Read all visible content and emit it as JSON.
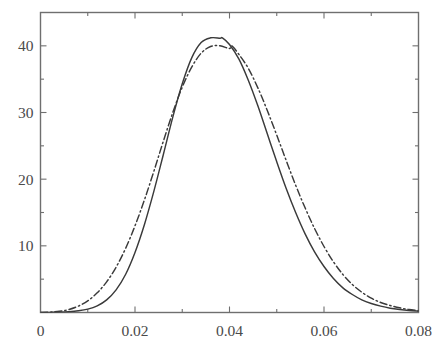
{
  "chart_data": {
    "type": "line",
    "title": "",
    "xlabel": "",
    "ylabel": "",
    "xlim": [
      0,
      0.08
    ],
    "ylim": [
      0,
      45
    ],
    "grid": false,
    "legend_position": "none",
    "x_ticks": [
      0,
      0.02,
      0.04,
      0.06,
      0.08
    ],
    "x_tick_labels": [
      "0",
      "0.02",
      "0.04",
      "0.06",
      "0.08"
    ],
    "x_minor_ticks": [
      0.01,
      0.03,
      0.05,
      0.07
    ],
    "y_ticks": [
      10,
      20,
      30,
      40
    ],
    "y_tick_labels": [
      "10",
      "20",
      "30",
      "40"
    ],
    "y_minor_ticks": [
      5,
      15,
      25,
      35,
      45
    ],
    "series": [
      {
        "name": "solid-curve",
        "style": "solid",
        "color": "#3a3a3a",
        "peak_x": 0.0385,
        "peak_y": 41.2,
        "x": [
          0.0,
          0.002,
          0.004,
          0.006,
          0.008,
          0.01,
          0.012,
          0.014,
          0.016,
          0.018,
          0.02,
          0.022,
          0.024,
          0.026,
          0.028,
          0.03,
          0.032,
          0.034,
          0.036,
          0.038,
          0.0385,
          0.04,
          0.042,
          0.044,
          0.046,
          0.048,
          0.05,
          0.052,
          0.054,
          0.056,
          0.058,
          0.06,
          0.062,
          0.064,
          0.066,
          0.068,
          0.07,
          0.072,
          0.074,
          0.076,
          0.078,
          0.08
        ],
        "y": [
          0.0,
          0.02,
          0.05,
          0.12,
          0.25,
          0.5,
          1.0,
          1.9,
          3.4,
          5.7,
          9.0,
          13.2,
          18.2,
          23.7,
          29.3,
          34.3,
          38.2,
          40.5,
          41.2,
          41.15,
          41.2,
          40.2,
          38.0,
          34.8,
          31.0,
          26.8,
          22.6,
          18.6,
          15.0,
          11.8,
          9.1,
          6.9,
          5.1,
          3.7,
          2.7,
          1.9,
          1.35,
          0.95,
          0.65,
          0.45,
          0.3,
          0.2
        ]
      },
      {
        "name": "dash-dot-curve",
        "style": "dashdot",
        "color": "#3a3a3a",
        "peak_x": 0.0405,
        "peak_y": 40.0,
        "x": [
          0.0,
          0.002,
          0.004,
          0.006,
          0.008,
          0.01,
          0.012,
          0.014,
          0.016,
          0.018,
          0.02,
          0.022,
          0.024,
          0.026,
          0.028,
          0.03,
          0.032,
          0.034,
          0.036,
          0.038,
          0.04,
          0.0405,
          0.042,
          0.044,
          0.046,
          0.048,
          0.05,
          0.052,
          0.054,
          0.056,
          0.058,
          0.06,
          0.062,
          0.064,
          0.066,
          0.068,
          0.07,
          0.072,
          0.074,
          0.076,
          0.078,
          0.08
        ],
        "y": [
          0.0,
          0.05,
          0.18,
          0.45,
          0.95,
          1.75,
          2.95,
          4.6,
          6.8,
          9.6,
          13.0,
          16.9,
          21.2,
          25.7,
          30.0,
          33.8,
          36.8,
          38.9,
          39.9,
          40.0,
          39.6,
          40.0,
          38.7,
          36.6,
          33.7,
          30.3,
          26.6,
          22.8,
          19.1,
          15.7,
          12.6,
          9.9,
          7.6,
          5.7,
          4.2,
          3.05,
          2.15,
          1.5,
          1.05,
          0.7,
          0.45,
          0.3
        ]
      }
    ]
  },
  "axes": {
    "frame_color": "#6f6f6f",
    "tick_color": "#6f6f6f",
    "background": "#ffffff"
  }
}
